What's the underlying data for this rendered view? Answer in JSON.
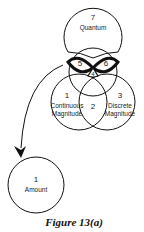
{
  "diagram": {
    "nodes": [
      {
        "id": "quantum",
        "number": "7",
        "label": "Quantum"
      },
      {
        "id": "continuous",
        "number": "1",
        "label_line1": "Continuous",
        "label_line2": "Magnitude"
      },
      {
        "id": "overlap",
        "number": "2"
      },
      {
        "id": "discrete",
        "number": "3",
        "label_line1": "Discrete",
        "label_line2": "Magnitude"
      },
      {
        "id": "center",
        "number": "4"
      },
      {
        "id": "left-lens",
        "number": "5"
      },
      {
        "id": "right-lens",
        "number": "6"
      },
      {
        "id": "amount",
        "number": "1",
        "label": "Amount"
      }
    ],
    "edges": [
      {
        "from": "left-lens",
        "to": "amount",
        "type": "arrow"
      }
    ]
  },
  "caption": "Figure 13(a)"
}
